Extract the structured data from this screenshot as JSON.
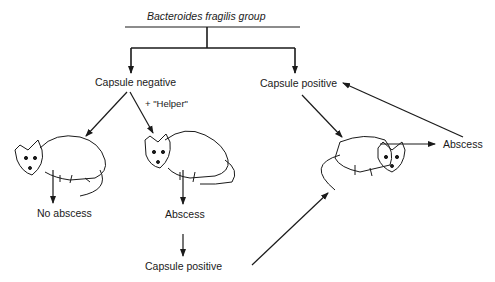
{
  "title": "Bacteroides fragilis group",
  "nodes": {
    "capsule_negative": "Capsule negative",
    "capsule_positive_top": "Capsule positive",
    "helper": "+ \"Helper\"",
    "no_abscess": "No abscess",
    "abscess_middle": "Abscess",
    "capsule_positive_bottom": "Capsule positive",
    "abscess_right": "Abscess"
  },
  "illustrations": [
    "rat-left",
    "rat-middle",
    "rat-right"
  ],
  "colors": {
    "line": "#1a1a1a",
    "background": "#ffffff"
  }
}
